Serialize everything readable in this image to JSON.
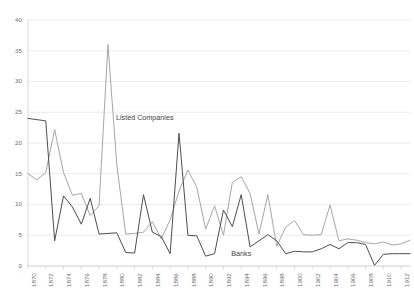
{
  "chart_data": {
    "type": "line",
    "title": "",
    "xlabel": "",
    "ylabel": "",
    "ylim": [
      0,
      40
    ],
    "ytick_values": [
      0,
      5,
      10,
      15,
      20,
      25,
      30,
      35,
      40
    ],
    "grid": true,
    "legend_position": "inline-annotations",
    "x": [
      1870,
      1871,
      1872,
      1873,
      1874,
      1875,
      1876,
      1877,
      1878,
      1879,
      1880,
      1881,
      1882,
      1883,
      1884,
      1885,
      1886,
      1887,
      1888,
      1889,
      1890,
      1891,
      1892,
      1893,
      1894,
      1895,
      1896,
      1897,
      1898,
      1899,
      1900,
      1901,
      1902,
      1903,
      1904,
      1905,
      1906,
      1907,
      1908,
      1909,
      1910,
      1911,
      1912,
      1913
    ],
    "xtick_labels": [
      "1870",
      "1872",
      "1874",
      "1876",
      "1878",
      "1880",
      "1882",
      "1884",
      "1886",
      "1888",
      "1890",
      "1892",
      "1894",
      "1896",
      "1898",
      "1900",
      "1902",
      "1904",
      "1906",
      "1908",
      "1910",
      "1912"
    ],
    "series": [
      {
        "name": "Listed Companies",
        "color": "#a6a6a6",
        "values": [
          15,
          14,
          15.2,
          22.2,
          15.2,
          11.5,
          11.8,
          8.2,
          9.8,
          36,
          16.4,
          5.2,
          5.3,
          5.5,
          7.2,
          4.4,
          7.5,
          12.2,
          15.6,
          12.8,
          6,
          9.8,
          5,
          13.6,
          14.5,
          11.8,
          5.2,
          11.6,
          3.2,
          6.3,
          7.4,
          5.1,
          5,
          5.1,
          9.9,
          4.1,
          4.4,
          4.2,
          3.8,
          3.6,
          3.9,
          3.4,
          3.6,
          4.2
        ],
        "annotation": "Listed Companies",
        "annotation_value": 24
      },
      {
        "name": "Banks",
        "color": "#4d4d4d",
        "values": [
          24,
          23.8,
          23.6,
          4.1,
          11.4,
          9.6,
          6.8,
          11,
          5.2,
          5.3,
          5.4,
          2.2,
          2.1,
          11.6,
          5.5,
          4.8,
          2,
          21.6,
          5,
          4.9,
          1.6,
          2,
          9.1,
          6.4,
          11.6,
          3.1,
          4.1,
          5.1,
          4.1,
          2,
          2.4,
          2.3,
          2.3,
          2.8,
          3.5,
          2.8,
          3.8,
          3.8,
          3.5,
          0.1,
          1.9,
          2,
          2,
          2
        ],
        "annotation": "Banks",
        "annotation_value": 3
      }
    ]
  },
  "annotations": {
    "listed_companies": "Listed Companies",
    "banks": "Banks"
  },
  "axis": {
    "y_labels": [
      "40",
      "35",
      "30",
      "25",
      "20",
      "15",
      "10",
      "5",
      "0"
    ],
    "x_labels": [
      "1870",
      "1872",
      "1874",
      "1876",
      "1878",
      "1880",
      "1882",
      "1884",
      "1886",
      "1888",
      "1890",
      "1892",
      "1894",
      "1896",
      "1898",
      "1900",
      "1902",
      "1904",
      "1906",
      "1908",
      "1910",
      "1912"
    ]
  },
  "colors": {
    "listed_companies_line": "#a6a6a6",
    "banks_line": "#4d4d4d",
    "gridline": "#e2e2e2",
    "axis_line": "#c9c9c9",
    "tick_text": "#6e6e6e",
    "background": "#ffffff"
  }
}
